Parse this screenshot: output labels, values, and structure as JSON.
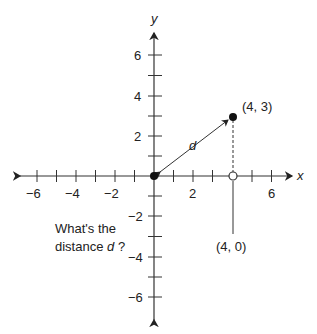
{
  "axes": {
    "x_label": "x",
    "y_label": "y",
    "x_ticks": [
      "−6",
      "−4",
      "−2",
      "2",
      "6"
    ],
    "y_ticks": [
      "6",
      "4",
      "2",
      "−2",
      "−4",
      "−6"
    ]
  },
  "points": {
    "p1_label": "(4, 3)",
    "p2_label": "(4, 0)"
  },
  "segment_label": "d",
  "question": {
    "line1": "What's the",
    "line2_prefix": "distance ",
    "line2_var": "d",
    "line2_suffix": " ?"
  }
}
